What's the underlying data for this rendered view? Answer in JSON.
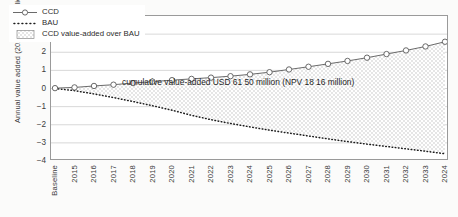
{
  "chart_data": {
    "type": "line",
    "title": "",
    "xlabel": "",
    "ylabel": "Annual value added (2014 USD million)",
    "ylim": [
      -4,
      4
    ],
    "yticks": [
      4,
      3,
      2,
      1,
      0,
      -1,
      -2,
      -3,
      -4
    ],
    "grid": true,
    "legend_position": "top-left-inside",
    "categories": [
      "Baseline",
      "2015",
      "2016",
      "2017",
      "2018",
      "2019",
      "2020",
      "2021",
      "2022",
      "2023",
      "2024",
      "2025",
      "2026",
      "2027",
      "2028",
      "2029",
      "2030",
      "2031",
      "2032",
      "2033",
      "2024"
    ],
    "series": [
      {
        "name": "CCD",
        "marker": "open-circle",
        "linestyle": "solid",
        "color": "#555555",
        "values": [
          0.02,
          0.06,
          0.14,
          0.21,
          0.3,
          0.38,
          0.46,
          0.53,
          0.6,
          0.68,
          0.78,
          0.9,
          1.05,
          1.2,
          1.36,
          1.52,
          1.7,
          1.9,
          2.1,
          2.32,
          2.58
        ]
      },
      {
        "name": "BAU",
        "marker": "none",
        "linestyle": "dotted",
        "color": "#1d1d1d",
        "values": [
          0.0,
          -0.12,
          -0.3,
          -0.5,
          -0.72,
          -0.95,
          -1.2,
          -1.48,
          -1.72,
          -1.93,
          -2.12,
          -2.3,
          -2.46,
          -2.62,
          -2.78,
          -2.93,
          -3.07,
          -3.2,
          -3.33,
          -3.46,
          -3.6
        ]
      }
    ],
    "band": {
      "name": "CCD value-added over BAU",
      "fill": "dotted-pattern",
      "between": [
        "CCD",
        "BAU"
      ]
    },
    "annotations": [
      {
        "name": "cumulative-value-annotation",
        "text": "cumulative value-added USD 61 50 million (NPV 18 16 million)"
      }
    ]
  },
  "legend": {
    "items": [
      {
        "label": "CCD",
        "key": "line-circle-marker"
      },
      {
        "label": "BAU",
        "key": "dotted-line"
      },
      {
        "label": "CCD value-added over BAU",
        "key": "dotted-fill-swatch"
      }
    ]
  }
}
